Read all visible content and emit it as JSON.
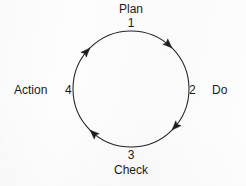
{
  "diagram": {
    "type": "pdca-cycle",
    "background_color": "#fdfdfd",
    "stroke_color": "#222222",
    "text_color": "#1a1a1a",
    "circle": {
      "center_x": 131,
      "center_y": 89,
      "radius": 58,
      "direction": "clockwise"
    },
    "nodes": [
      {
        "id": "plan",
        "number": "1",
        "label": "Plan",
        "position": "top",
        "angle_deg": 90
      },
      {
        "id": "do",
        "number": "2",
        "label": "Do",
        "position": "right",
        "angle_deg": 0
      },
      {
        "id": "check",
        "number": "3",
        "label": "Check",
        "position": "bottom",
        "angle_deg": 270
      },
      {
        "id": "action",
        "number": "4",
        "label": "Action",
        "position": "left",
        "angle_deg": 180
      }
    ],
    "arrowheads": [
      {
        "id": "arrow-upper-right",
        "angle_deg": 45,
        "direction": "clockwise"
      },
      {
        "id": "arrow-lower-right",
        "angle_deg": 315,
        "direction": "clockwise"
      },
      {
        "id": "arrow-lower-left",
        "angle_deg": 225,
        "direction": "clockwise"
      },
      {
        "id": "arrow-upper-left",
        "angle_deg": 135,
        "direction": "clockwise"
      }
    ]
  }
}
